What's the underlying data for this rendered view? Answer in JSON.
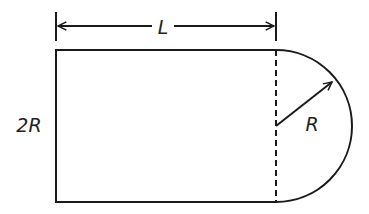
{
  "diagram": {
    "labels": {
      "length": "L",
      "height": "2R",
      "radius": "R"
    },
    "colors": {
      "stroke": "#1a1a1a",
      "background": "#ffffff"
    },
    "shapes": {
      "rectangle": {
        "x": 56,
        "y": 50,
        "width": 220,
        "height": 152
      },
      "semicircle": {
        "cx": 276,
        "cy": 126,
        "r": 76,
        "side": "right"
      },
      "dashed_divider": {
        "x": 276,
        "y1": 50,
        "y2": 202
      },
      "radius_arrow": {
        "x1": 276,
        "y1": 126,
        "x2": 333,
        "y2": 81
      },
      "dimension_L": {
        "x1": 56,
        "x2": 276,
        "y": 26,
        "tick_top": 12,
        "tick_bottom": 41
      }
    }
  }
}
